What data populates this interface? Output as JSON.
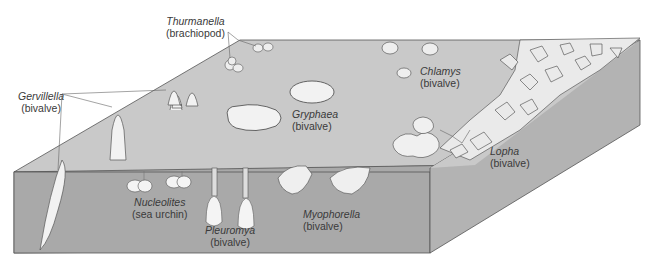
{
  "figure": {
    "colors": {
      "surface": "#c9c9c9",
      "front_face": "#a9a9a9",
      "side_face": "#b3b3b3",
      "outline": "#555555",
      "shell": "#f2f2f2",
      "label_text": "#3a3a3a"
    }
  },
  "labels": [
    {
      "id": "thurmanella",
      "genus": "Thurmanella",
      "type": "(brachiopod)"
    },
    {
      "id": "gervillella",
      "genus": "Gervillella",
      "type": "(bivalve)"
    },
    {
      "id": "gryphaea",
      "genus": "Gryphaea",
      "type": "(bivalve)"
    },
    {
      "id": "chlamys",
      "genus": "Chlamys",
      "type": "(bivalve)"
    },
    {
      "id": "lopha",
      "genus": "Lopha",
      "type": "(bivalve)"
    },
    {
      "id": "nucleolites",
      "genus": "Nucleolites",
      "type": "(sea urchin)"
    },
    {
      "id": "pleuromya",
      "genus": "Pleuromya",
      "type": "(bivalve)"
    },
    {
      "id": "myophorella",
      "genus": "Myophorella",
      "type": "(bivalve)"
    }
  ]
}
